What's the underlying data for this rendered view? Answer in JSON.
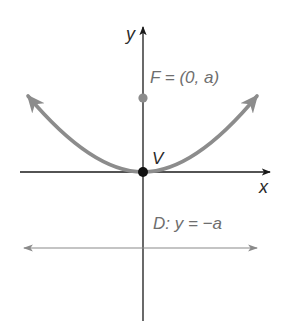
{
  "figure": {
    "labels": {
      "y_axis": "y",
      "x_axis": "x",
      "focus": "F = (0, a)",
      "vertex": "V",
      "directrix": "D: y = −a"
    },
    "colors": {
      "axes": "#1a1a1a",
      "parabola": "#8c8c8c",
      "focus_point": "#8c8c8c",
      "vertex_point": "#111111",
      "directrix": "#8a8a8a",
      "label_text": "#6e6e6e"
    },
    "elements": {
      "vertex": {
        "x": 0,
        "y": 0
      },
      "focus": {
        "x": 0,
        "y": "a"
      },
      "directrix": "y = -a",
      "parabola": "x^2 = 4ay (opens upward)"
    }
  }
}
